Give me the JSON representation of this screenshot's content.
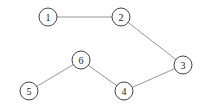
{
  "diagram": {
    "type": "undirected-graph",
    "node_radius": 9,
    "colors": {
      "edge": "#8a8a8a",
      "node_stroke": "#444444",
      "node_fill": "#ffffff",
      "label": "#222222"
    },
    "nodes": [
      {
        "id": "1",
        "label": "1",
        "x": 48,
        "y": 17
      },
      {
        "id": "2",
        "label": "2",
        "x": 121,
        "y": 17
      },
      {
        "id": "3",
        "label": "3",
        "x": 183,
        "y": 65
      },
      {
        "id": "4",
        "label": "4",
        "x": 124,
        "y": 91
      },
      {
        "id": "5",
        "label": "5",
        "x": 29,
        "y": 91
      },
      {
        "id": "6",
        "label": "6",
        "x": 81,
        "y": 60
      }
    ],
    "edges": [
      {
        "from": "1",
        "to": "2"
      },
      {
        "from": "2",
        "to": "3"
      },
      {
        "from": "3",
        "to": "4"
      },
      {
        "from": "4",
        "to": "6"
      },
      {
        "from": "6",
        "to": "5"
      }
    ]
  }
}
